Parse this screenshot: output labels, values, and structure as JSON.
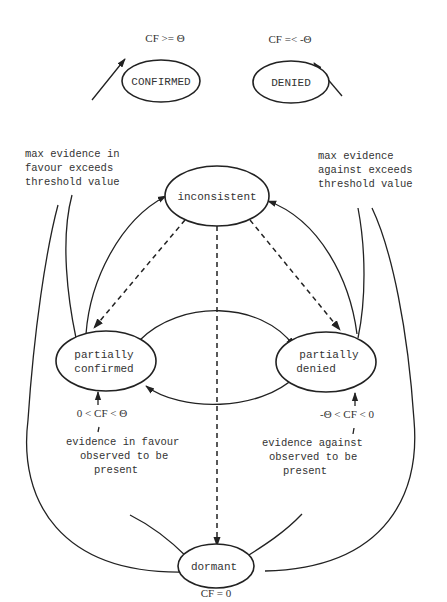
{
  "diagram": {
    "type": "state-transition",
    "nodes": {
      "confirmed": {
        "label": "CONFIRMED",
        "condition": "CF >=  Θ"
      },
      "denied": {
        "label": "DENIED",
        "condition": "CF =< -Θ"
      },
      "inconsistent": {
        "label": "inconsistent"
      },
      "partially_confirmed": {
        "label_line1": "partially",
        "label_line2": "confirmed",
        "condition": "0 < CF < Θ"
      },
      "partially_denied": {
        "label_line1": "partially",
        "label_line2": "denied",
        "condition": "-Θ < CF < 0"
      },
      "dormant": {
        "label": "dormant",
        "condition": "CF = 0"
      }
    },
    "edge_labels": {
      "favour_threshold": [
        "max evidence in",
        "favour exceeds",
        "threshold value"
      ],
      "against_threshold": [
        "max evidence",
        "against exceeds",
        "threshold value"
      ],
      "favour_present": [
        "evidence in favour",
        "observed to be",
        "present"
      ],
      "against_present": [
        "evidence against",
        "observed to be",
        "present"
      ]
    },
    "edges": [
      {
        "from": "partially_confirmed",
        "to": "confirmed",
        "style": "solid",
        "label": "favour_threshold"
      },
      {
        "from": "dormant",
        "to": "confirmed",
        "style": "solid",
        "label": "favour_threshold"
      },
      {
        "from": "partially_denied",
        "to": "denied",
        "style": "solid",
        "label": "against_threshold"
      },
      {
        "from": "dormant",
        "to": "denied",
        "style": "solid",
        "label": "against_threshold"
      },
      {
        "from": "partially_confirmed",
        "to": "inconsistent",
        "style": "solid"
      },
      {
        "from": "partially_denied",
        "to": "inconsistent",
        "style": "solid"
      },
      {
        "from": "inconsistent",
        "to": "partially_confirmed",
        "style": "dashed"
      },
      {
        "from": "inconsistent",
        "to": "partially_denied",
        "style": "dashed"
      },
      {
        "from": "inconsistent",
        "to": "dormant",
        "style": "dashed"
      },
      {
        "from": "partially_confirmed",
        "to": "partially_denied",
        "style": "solid"
      },
      {
        "from": "partially_denied",
        "to": "partially_confirmed",
        "style": "solid"
      },
      {
        "from": "dormant",
        "to": "partially_confirmed",
        "style": "solid",
        "label": "favour_present"
      },
      {
        "from": "dormant",
        "to": "partially_denied",
        "style": "solid",
        "label": "against_present"
      }
    ]
  }
}
